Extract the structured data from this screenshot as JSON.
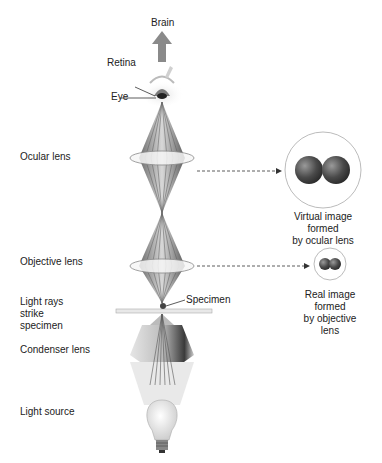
{
  "diagram": {
    "labels": {
      "brain": "Brain",
      "retina": "Retina",
      "eye": "Eye",
      "ocular_lens": "Ocular lens",
      "objective_lens": "Objective lens",
      "light_rays_line1": "Light rays",
      "light_rays_line2": "strike",
      "light_rays_line3": "specimen",
      "specimen": "Specimen",
      "condenser_lens": "Condenser lens",
      "light_source": "Light source"
    },
    "virtual_image": {
      "line1": "Virtual image",
      "line2": "formed",
      "line3": "by ocular lens"
    },
    "real_image": {
      "line1": "Real image",
      "line2": "formed",
      "line3": "by objective",
      "line4": "lens"
    },
    "colors": {
      "arrow": "#8a8a8a",
      "cone": "#9a9a9a",
      "lens": "#f4f4f4",
      "sphere": "#555555",
      "circle_stroke": "#9a9a9a"
    }
  }
}
